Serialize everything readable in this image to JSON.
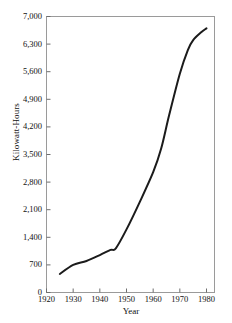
{
  "chart_data": {
    "type": "line",
    "title": "",
    "xlabel": "Year",
    "ylabel": "Kilowatt-Hours",
    "xlim": [
      1920,
      1983
    ],
    "ylim": [
      0,
      7000
    ],
    "grid": false,
    "legend": null,
    "xticks": [
      1920,
      1930,
      1940,
      1950,
      1960,
      1970,
      1980
    ],
    "xtick_labels": [
      "1920",
      "1930",
      "1940",
      "1950",
      "1960",
      "1970",
      "1980"
    ],
    "yticks": [
      0,
      700,
      1400,
      2100,
      2800,
      3500,
      4200,
      4900,
      5600,
      6300,
      7000
    ],
    "ytick_labels": [
      "0",
      "700",
      "1,400",
      "2,100",
      "2,800",
      "3,500",
      "4,200",
      "4,900",
      "5,600",
      "6,300",
      "7,000"
    ],
    "series": [
      {
        "name": "Kilowatt-Hours",
        "color": "#1b1b1b",
        "x": [
          1925,
          1930,
          1935,
          1940,
          1944,
          1946,
          1950,
          1955,
          1960,
          1963,
          1966,
          1970,
          1973,
          1975,
          1978,
          1980
        ],
        "values": [
          470,
          700,
          800,
          950,
          1080,
          1120,
          1600,
          2300,
          3050,
          3650,
          4500,
          5550,
          6150,
          6400,
          6600,
          6700
        ]
      }
    ]
  },
  "axis": {
    "ylabel": "Kilowatt-Hours",
    "xlabel": "Year"
  }
}
